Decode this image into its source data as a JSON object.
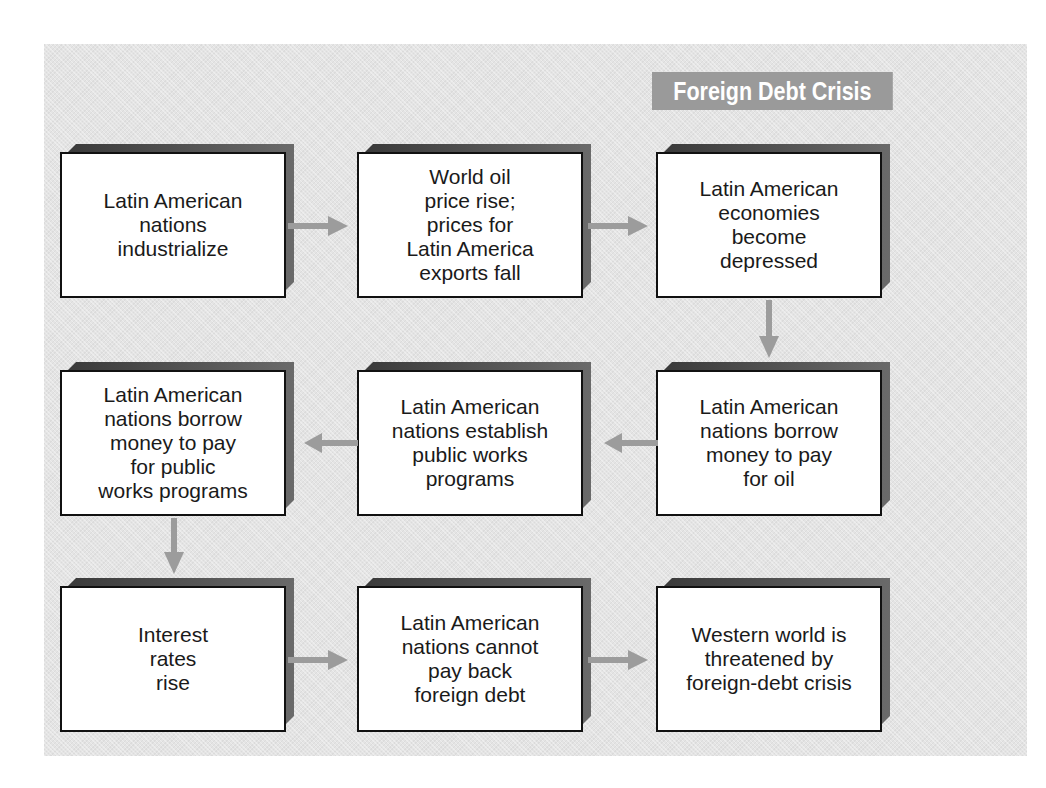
{
  "title": "Foreign Debt Crisis",
  "colors": {
    "panel_background": "#e4e4e4",
    "title_badge": "#9a9a9a",
    "arrow": "#9c9c9c",
    "box_border": "#111111",
    "box_shadow": "#4a4a4a"
  },
  "flow": {
    "row1": [
      {
        "id": "step-1",
        "label": "Latin American\nnations\nindustrialize"
      },
      {
        "id": "step-2",
        "label": "World oil\nprice rise;\nprices for\nLatin America\nexports fall"
      },
      {
        "id": "step-3",
        "label": "Latin American\neconomies\nbecome\ndepressed"
      }
    ],
    "row2": [
      {
        "id": "step-6",
        "label": "Latin American\nnations borrow\nmoney to pay\nfor public\nworks programs"
      },
      {
        "id": "step-5",
        "label": "Latin American\nnations establish\npublic works\nprograms"
      },
      {
        "id": "step-4",
        "label": "Latin American\nnations borrow\nmoney to pay\nfor oil"
      }
    ],
    "row3": [
      {
        "id": "step-7",
        "label": "Interest\nrates\nrise"
      },
      {
        "id": "step-8",
        "label": "Latin American\nnations cannot\npay back\nforeign debt"
      },
      {
        "id": "step-9",
        "label": "Western world is\nthreatened by\nforeign-debt crisis"
      }
    ]
  },
  "connections": [
    {
      "from": "step-1",
      "to": "step-2",
      "direction": "right"
    },
    {
      "from": "step-2",
      "to": "step-3",
      "direction": "right"
    },
    {
      "from": "step-3",
      "to": "step-4",
      "direction": "down"
    },
    {
      "from": "step-4",
      "to": "step-5",
      "direction": "left"
    },
    {
      "from": "step-5",
      "to": "step-6",
      "direction": "left"
    },
    {
      "from": "step-6",
      "to": "step-7",
      "direction": "down"
    },
    {
      "from": "step-7",
      "to": "step-8",
      "direction": "right"
    },
    {
      "from": "step-8",
      "to": "step-9",
      "direction": "right"
    }
  ]
}
